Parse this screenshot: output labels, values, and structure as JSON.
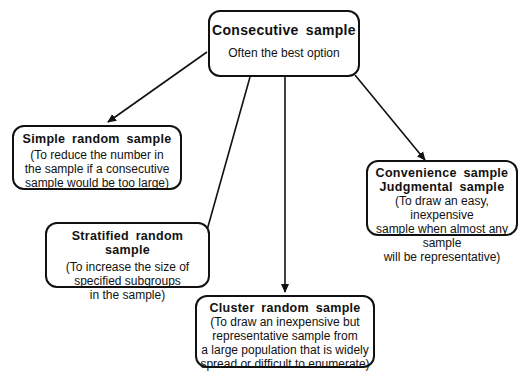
{
  "diagram": {
    "root": {
      "title": "Consecutive sample",
      "subtitle": "Often the best option"
    },
    "nodes": [
      {
        "id": "simple",
        "title": "Simple random sample",
        "lines": [
          "(To reduce the number in",
          "the sample if a consecutive",
          "sample would be too large)"
        ]
      },
      {
        "id": "stratified",
        "title": "Stratified random sample",
        "lines": [
          "(To increase the size of",
          "specified subgroups",
          "in the sample)"
        ]
      },
      {
        "id": "cluster",
        "title": "Cluster random sample",
        "lines": [
          "(To draw an inexpensive but",
          "representative sample from",
          "a large population that is widely",
          "spread or difficult to enumerate)"
        ]
      },
      {
        "id": "convenience",
        "title": "Convenience sample",
        "title2": "Judgmental sample",
        "lines": [
          "(To draw an easy, inexpensive",
          "sample when almost any sample",
          "will be representative)"
        ]
      }
    ],
    "edges": [
      {
        "from": "root",
        "to": "simple"
      },
      {
        "from": "root",
        "to": "stratified"
      },
      {
        "from": "root",
        "to": "cluster"
      },
      {
        "from": "root",
        "to": "convenience"
      }
    ]
  }
}
